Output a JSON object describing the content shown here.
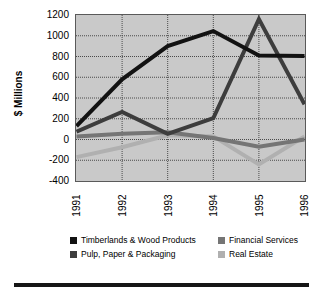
{
  "chart_data": {
    "type": "line",
    "title": "",
    "xlabel": "",
    "ylabel": "$ Millions",
    "categories": [
      "1991",
      "1992",
      "1993",
      "1994",
      "1995",
      "1996"
    ],
    "ylim": [
      -400,
      1200
    ],
    "yticks": [
      1200,
      1000,
      800,
      600,
      400,
      200,
      0,
      -200,
      -400
    ],
    "grid": true,
    "legend_position": "bottom",
    "series": [
      {
        "name": "Timberlands & Wood Products",
        "color": "#121212",
        "values": [
          130,
          580,
          900,
          1045,
          810,
          805
        ]
      },
      {
        "name": "Pulp, Paper & Packaging",
        "color": "#3d3d3d",
        "values": [
          75,
          265,
          55,
          205,
          1160,
          340
        ]
      },
      {
        "name": "Financial Services",
        "color": "#757575",
        "values": [
          30,
          55,
          70,
          15,
          -70,
          0
        ]
      },
      {
        "name": "Real Estate",
        "color": "#b0b0b0",
        "values": [
          -170,
          -75,
          40,
          30,
          -240,
          30
        ]
      }
    ]
  },
  "legend": {
    "items": [
      {
        "label": "Timberlands & Wood Products",
        "color": "#121212"
      },
      {
        "label": "Financial Services",
        "color": "#757575"
      },
      {
        "label": "Pulp, Paper & Packaging",
        "color": "#3d3d3d"
      },
      {
        "label": "Real Estate",
        "color": "#b0b0b0"
      }
    ]
  },
  "style": {
    "plot_background": "#c9c9c9",
    "plot_border": "#5a5a5a",
    "gridline_color": "#4a4a4a",
    "rule_color": "#161616"
  }
}
